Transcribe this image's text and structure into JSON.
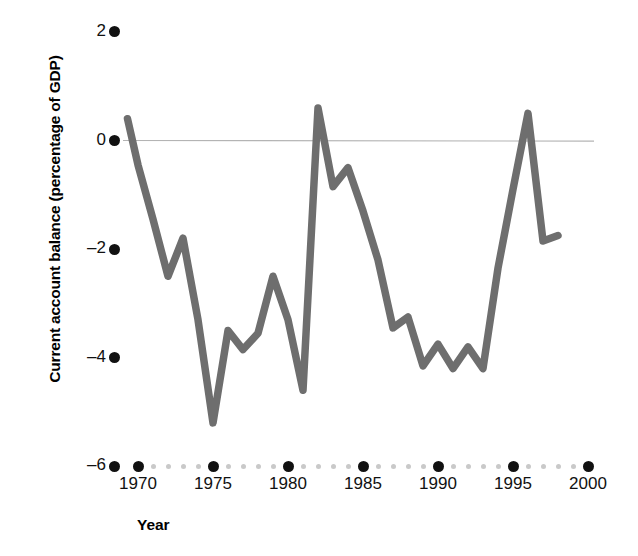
{
  "chart_data": {
    "type": "line",
    "title": "",
    "xlabel": "Year",
    "ylabel": "Current account balance (percentage of GDP)",
    "xlim": [
      1968.5,
      2000.5
    ],
    "ylim": [
      -6.4,
      2.4
    ],
    "grid": false,
    "legend": null,
    "zero_line": 0,
    "series_color": "#6e6e6e",
    "x": [
      1969.3,
      1970,
      1971,
      1972,
      1973,
      1974,
      1975,
      1976,
      1977,
      1978,
      1979,
      1980,
      1981,
      1982,
      1983,
      1984,
      1985,
      1986,
      1987,
      1988,
      1989,
      1990,
      1991,
      1992,
      1993,
      1994,
      1995,
      1996,
      1997,
      1998
    ],
    "values": [
      0.4,
      -0.45,
      -1.45,
      -2.5,
      -1.8,
      -3.3,
      -5.2,
      -3.5,
      -3.85,
      -3.55,
      -2.5,
      -3.3,
      -4.6,
      0.6,
      -0.85,
      -0.5,
      -1.3,
      -2.2,
      -3.45,
      -3.25,
      -4.15,
      -3.75,
      -4.2,
      -3.8,
      -4.2,
      -2.35,
      -0.9,
      0.5,
      -1.85,
      -1.75
    ],
    "xticks_major": [
      1970,
      1975,
      1980,
      1985,
      1990,
      1995,
      2000
    ],
    "xticks_major_labels": [
      "1970",
      "1975",
      "1980",
      "1985",
      "1990",
      "1995",
      "2000"
    ],
    "xticks_minor": [
      1971,
      1972,
      1973,
      1974,
      1976,
      1977,
      1978,
      1979,
      1981,
      1982,
      1983,
      1984,
      1986,
      1987,
      1988,
      1989,
      1991,
      1992,
      1993,
      1994,
      1996,
      1997,
      1998,
      1999
    ],
    "yticks": [
      2,
      0,
      -2,
      -4,
      -6
    ],
    "ytick_labels": [
      "2",
      "0",
      "–2",
      "–4",
      "–6"
    ]
  }
}
